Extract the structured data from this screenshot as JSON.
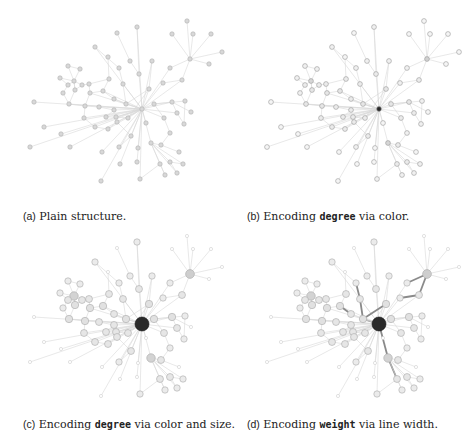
{
  "figure": {
    "panels": [
      {
        "id": "a",
        "label": "(a)",
        "text_before": " Plain structure.",
        "code": "",
        "text_after": "",
        "mode": "plain",
        "origin": [
          0,
          0
        ],
        "caption_pos": [
          23,
          210
        ]
      },
      {
        "id": "b",
        "label": "(b)",
        "text_before": " Encoding ",
        "code": "degree",
        "text_after": " via color.",
        "mode": "color",
        "origin": [
          237,
          0
        ],
        "caption_pos": [
          247,
          210
        ]
      },
      {
        "id": "c",
        "label": "(c)",
        "text_before": " Encoding ",
        "code": "degree",
        "text_after": " via color and size.",
        "mode": "color_size",
        "origin": [
          0,
          215
        ],
        "caption_pos": [
          23,
          418
        ]
      },
      {
        "id": "d",
        "label": "(d)",
        "text_before": " Encoding ",
        "code": "weight",
        "text_after": " via line width.",
        "mode": "weight",
        "origin": [
          237,
          215
        ],
        "caption_pos": [
          247,
          418
        ]
      }
    ]
  },
  "graph": {
    "nodes": [
      [
        187,
        21
      ],
      [
        137,
        27
      ],
      [
        117,
        33
      ],
      [
        172,
        34
      ],
      [
        193,
        34
      ],
      [
        211,
        34
      ],
      [
        95,
        47
      ],
      [
        108,
        57
      ],
      [
        190,
        59
      ],
      [
        222,
        52
      ],
      [
        130,
        61
      ],
      [
        152,
        61
      ],
      [
        209,
        64
      ],
      [
        68,
        66
      ],
      [
        119,
        68
      ],
      [
        80,
        69
      ],
      [
        170,
        68
      ],
      [
        139,
        74
      ],
      [
        109,
        79
      ],
      [
        182,
        80
      ],
      [
        60,
        78
      ],
      [
        123,
        84
      ],
      [
        74,
        81
      ],
      [
        89,
        84
      ],
      [
        149,
        89
      ],
      [
        163,
        83
      ],
      [
        68,
        85
      ],
      [
        82,
        85
      ],
      [
        75,
        90
      ],
      [
        63,
        93
      ],
      [
        90,
        93
      ],
      [
        103,
        91
      ],
      [
        34,
        102
      ],
      [
        69,
        104
      ],
      [
        85,
        106
      ],
      [
        99,
        107
      ],
      [
        114,
        99
      ],
      [
        126,
        104
      ],
      [
        154,
        104
      ],
      [
        172,
        102
      ],
      [
        185,
        101
      ],
      [
        114,
        110
      ],
      [
        142,
        109
      ],
      [
        177,
        113
      ],
      [
        191,
        112
      ],
      [
        84,
        118
      ],
      [
        106,
        117
      ],
      [
        116,
        117
      ],
      [
        128,
        118
      ],
      [
        164,
        118
      ],
      [
        44,
        127
      ],
      [
        95,
        127
      ],
      [
        108,
        129
      ],
      [
        117,
        122
      ],
      [
        146,
        123
      ],
      [
        184,
        124
      ],
      [
        61,
        134
      ],
      [
        131,
        136
      ],
      [
        170,
        133
      ],
      [
        151,
        143
      ],
      [
        161,
        145
      ],
      [
        30,
        147
      ],
      [
        70,
        147
      ],
      [
        119,
        147
      ],
      [
        138,
        148
      ],
      [
        102,
        152
      ],
      [
        179,
        152
      ],
      [
        160,
        164
      ],
      [
        170,
        162
      ],
      [
        137,
        162
      ],
      [
        120,
        164
      ],
      [
        183,
        164
      ],
      [
        165,
        175
      ],
      [
        177,
        173
      ],
      [
        140,
        179
      ],
      [
        101,
        181
      ]
    ],
    "hub": 42,
    "secondary": [
      8,
      87
    ],
    "edges": [
      [
        42,
        24
      ],
      [
        42,
        38
      ],
      [
        42,
        41
      ],
      [
        42,
        37
      ],
      [
        42,
        36
      ],
      [
        42,
        48
      ],
      [
        42,
        54
      ],
      [
        42,
        57
      ],
      [
        42,
        59
      ],
      [
        42,
        64
      ],
      [
        42,
        63
      ],
      [
        42,
        53
      ],
      [
        42,
        47
      ],
      [
        42,
        43
      ],
      [
        42,
        39
      ],
      [
        42,
        49
      ],
      [
        42,
        25
      ],
      [
        42,
        17
      ],
      [
        42,
        11
      ],
      [
        42,
        21
      ],
      [
        42,
        31
      ],
      [
        42,
        35
      ],
      [
        42,
        30
      ],
      [
        42,
        46
      ],
      [
        42,
        52
      ],
      [
        42,
        51
      ],
      [
        42,
        56
      ],
      [
        42,
        62
      ],
      [
        42,
        65
      ],
      [
        42,
        74
      ],
      [
        42,
        75
      ],
      [
        42,
        69
      ],
      [
        42,
        70
      ],
      [
        42,
        45
      ],
      [
        42,
        50
      ],
      [
        42,
        33
      ],
      [
        42,
        32
      ],
      [
        42,
        61
      ],
      [
        42,
        1
      ],
      [
        42,
        6
      ],
      [
        42,
        16
      ],
      [
        42,
        19
      ],
      [
        19,
        8
      ],
      [
        8,
        0
      ],
      [
        8,
        3
      ],
      [
        8,
        4
      ],
      [
        8,
        5
      ],
      [
        8,
        9
      ],
      [
        8,
        12
      ],
      [
        8,
        16
      ],
      [
        19,
        25
      ],
      [
        59,
        60
      ],
      [
        59,
        67
      ],
      [
        59,
        68
      ],
      [
        59,
        71
      ],
      [
        59,
        72
      ],
      [
        59,
        73
      ],
      [
        67,
        72
      ],
      [
        68,
        73
      ],
      [
        60,
        66
      ],
      [
        60,
        58
      ],
      [
        67,
        74
      ],
      [
        68,
        71
      ],
      [
        38,
        39
      ],
      [
        38,
        40
      ],
      [
        39,
        43
      ],
      [
        39,
        44
      ],
      [
        43,
        55
      ],
      [
        40,
        55
      ],
      [
        38,
        49
      ],
      [
        49,
        58
      ],
      [
        22,
        13
      ],
      [
        22,
        15
      ],
      [
        22,
        26
      ],
      [
        22,
        27
      ],
      [
        22,
        28
      ],
      [
        22,
        20
      ],
      [
        13,
        15
      ],
      [
        26,
        29
      ],
      [
        27,
        28
      ],
      [
        23,
        27
      ],
      [
        23,
        30
      ],
      [
        30,
        31
      ],
      [
        31,
        36
      ],
      [
        36,
        37
      ],
      [
        37,
        24
      ],
      [
        28,
        33
      ],
      [
        29,
        33
      ],
      [
        33,
        34
      ],
      [
        34,
        35
      ],
      [
        35,
        41
      ],
      [
        41,
        46
      ],
      [
        46,
        47
      ],
      [
        47,
        48
      ],
      [
        48,
        24
      ],
      [
        34,
        45
      ],
      [
        45,
        51
      ],
      [
        51,
        52
      ],
      [
        52,
        53
      ],
      [
        53,
        57
      ],
      [
        57,
        63
      ],
      [
        2,
        10
      ],
      [
        10,
        17
      ],
      [
        7,
        18
      ],
      [
        18,
        23
      ],
      [
        14,
        21
      ],
      [
        21,
        37
      ],
      [
        6,
        14
      ],
      [
        1,
        17
      ],
      [
        11,
        24
      ],
      [
        31,
        18
      ],
      [
        26,
        20
      ],
      [
        28,
        22
      ],
      [
        30,
        34
      ]
    ],
    "heavy_edges": [
      [
        42,
        37
      ],
      [
        37,
        24
      ],
      [
        24,
        36
      ],
      [
        36,
        31
      ],
      [
        21,
        37
      ],
      [
        14,
        21
      ],
      [
        42,
        59
      ],
      [
        59,
        67
      ],
      [
        8,
        19
      ],
      [
        19,
        25
      ],
      [
        8,
        16
      ],
      [
        16,
        25
      ]
    ]
  },
  "colors": {
    "edge": "#d9d9d9",
    "node_plain_fill": "#d8d8d8",
    "node_stroke": "#b0b0b0",
    "hub": "#2a2a2a",
    "text": "#222222"
  }
}
